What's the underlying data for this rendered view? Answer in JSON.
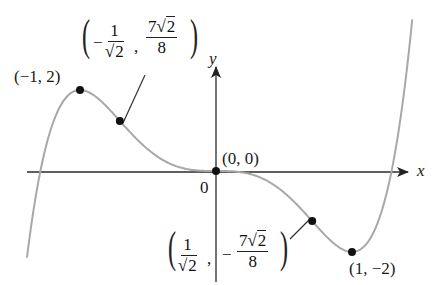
{
  "chart_data": {
    "type": "line",
    "title": "",
    "function": "f(x) = 3x^5 - 5x^3",
    "xlabel": "x",
    "ylabel": "y",
    "origin_label": "0",
    "xlim": [
      -1.39,
      1.45
    ],
    "ylim": [
      -2.5,
      3.7
    ],
    "grid": false,
    "series": [
      {
        "name": "f(x)",
        "color": "#a8a8a8"
      }
    ],
    "points": [
      {
        "x": -1,
        "y": 2,
        "label": "(−1, 2)",
        "kind": "local max"
      },
      {
        "x": -0.7071,
        "y": 1.2374,
        "label": "(−1/√2, 7√2/8)",
        "kind": "inflection"
      },
      {
        "x": 0,
        "y": 0,
        "label": "(0, 0)",
        "kind": "inflection"
      },
      {
        "x": 0.7071,
        "y": -1.2374,
        "label": "(1/√2, −7√2/8)",
        "kind": "inflection"
      },
      {
        "x": 1,
        "y": -2,
        "label": "(1, −2)",
        "kind": "local min"
      }
    ]
  },
  "labels": {
    "y_axis": "y",
    "x_axis": "x",
    "origin": "0",
    "p_max": "(−1, 2)",
    "p_origin": "(0, 0)",
    "p_min": "(1, −2)",
    "infl_left": {
      "sign": "−",
      "num": "1",
      "den_rad": "2",
      "y_num_coef": "7",
      "y_num_rad": "2",
      "y_den": "8"
    },
    "infl_right": {
      "num": "1",
      "den_rad": "2",
      "y_sign": "−",
      "y_num_coef": "7",
      "y_num_rad": "2",
      "y_den": "8"
    },
    "sqrt_symbol": "√",
    "comma": ",",
    "lparen": "(",
    "rparen": ")"
  }
}
